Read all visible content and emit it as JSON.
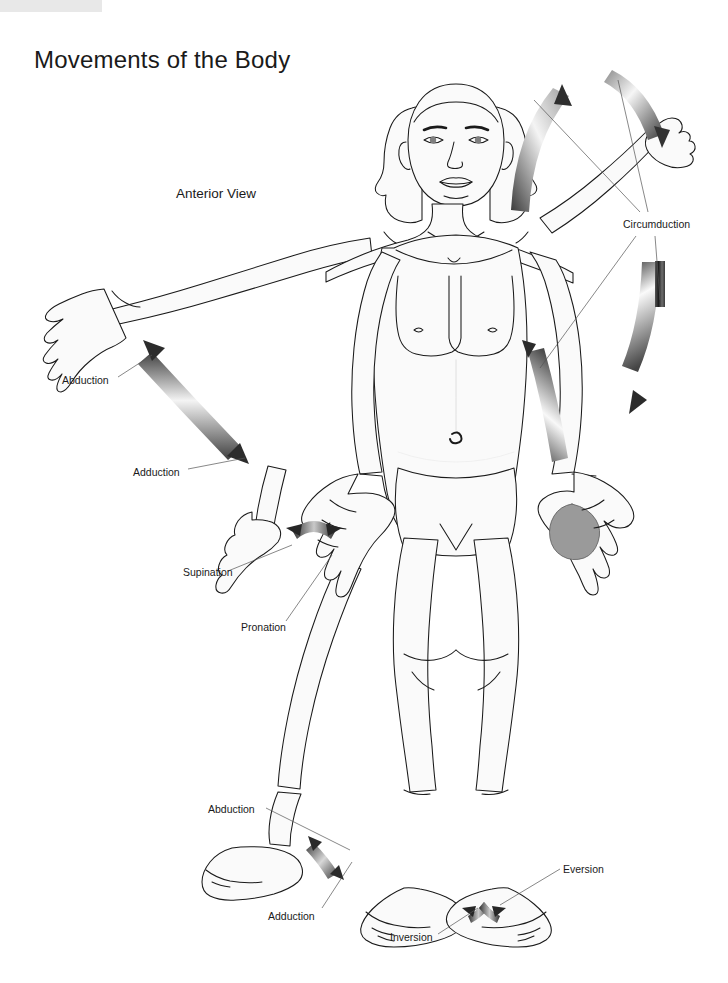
{
  "page": {
    "title": "Movements of the Body",
    "view_label": "Anterior View",
    "background_color": "#ffffff",
    "corner_block_color": "#e8e8e8",
    "body_fill_color": "#fafafa",
    "outline_color": "#1a1a1a",
    "arrow_dark_color": "#4a4a4a",
    "arrow_light_color": "#f2f2f2",
    "shaded_hand_color": "#9a9a9a",
    "text_color": "#1a1a1a"
  },
  "annotations": [
    {
      "id": "arm-abduction",
      "label": "Abduction",
      "x": 62,
      "y": 374
    },
    {
      "id": "arm-adduction",
      "label": "Adduction",
      "x": 133,
      "y": 466
    },
    {
      "id": "supination",
      "label": "Supination",
      "x": 183,
      "y": 568
    },
    {
      "id": "pronation",
      "label": "Pronation",
      "x": 241,
      "y": 623
    },
    {
      "id": "circumduction",
      "label": "Circumduction",
      "x": 623,
      "y": 219
    },
    {
      "id": "foot-abduction",
      "label": "Abduction",
      "x": 208,
      "y": 805
    },
    {
      "id": "foot-adduction",
      "label": "Adduction",
      "x": 268,
      "y": 911
    },
    {
      "id": "eversion",
      "label": "Eversion",
      "x": 563,
      "y": 864
    },
    {
      "id": "inversion",
      "label": "Inversion",
      "x": 390,
      "y": 933
    }
  ],
  "figure": {
    "movement_arrows": [
      {
        "name": "shoulder-abduction-adduction-arrow",
        "type": "double-headed-curved"
      },
      {
        "name": "shoulder-circumduction-upper-arrow",
        "type": "single-headed-curved"
      },
      {
        "name": "shoulder-circumduction-outer-arrow",
        "type": "single-headed-curved"
      },
      {
        "name": "shoulder-circumduction-vertical-arrow",
        "type": "single-headed-curved"
      },
      {
        "name": "shoulder-circumduction-lateral-arrow",
        "type": "single-headed-straight"
      },
      {
        "name": "forearm-supination-pronation-arrow",
        "type": "double-headed-curved"
      },
      {
        "name": "hip-abduction-adduction-arrow",
        "type": "double-headed-curved"
      },
      {
        "name": "foot-inversion-eversion-arrow",
        "type": "double-headed-curved"
      }
    ]
  }
}
